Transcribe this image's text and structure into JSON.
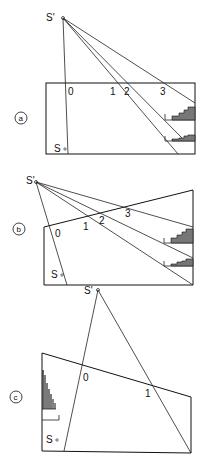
{
  "panels": [
    {
      "id": "a",
      "label": "a",
      "source_prime": "S'",
      "source": "S",
      "scale_marks": [
        "0",
        "1",
        "2",
        "3"
      ]
    },
    {
      "id": "b",
      "label": "b",
      "source_prime": "S'",
      "source": "S",
      "scale_marks": [
        "0",
        "1",
        "2",
        "3"
      ]
    },
    {
      "id": "c",
      "label": "c",
      "source_prime": "S'",
      "source": "S",
      "scale_marks": [
        "0",
        "1"
      ]
    }
  ],
  "colors": {
    "line": "#222222",
    "hatch": "#777777",
    "background": "#ffffff"
  }
}
